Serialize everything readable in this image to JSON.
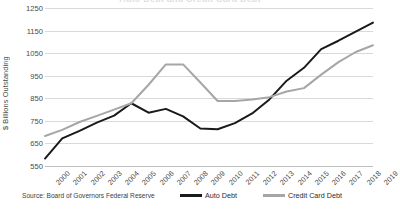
{
  "chart_data": {
    "type": "line",
    "title": "Auto Debt and Credit Card Debt",
    "xlabel": "",
    "ylabel": "$ Billions Outstanding",
    "ylim": [
      550,
      1250
    ],
    "ytick_step": 100,
    "yticks": [
      1250,
      1150,
      1050,
      950,
      850,
      750,
      650,
      550
    ],
    "grid": true,
    "legend_position": "bottom",
    "categories": [
      "2000",
      "2001",
      "2002",
      "2003",
      "2004",
      "2005",
      "2006",
      "2007",
      "2008",
      "2009",
      "2010",
      "2011",
      "2012",
      "2013",
      "2014",
      "2015",
      "2016",
      "2017",
      "2018",
      "2019"
    ],
    "series": [
      {
        "name": "Auto Debt",
        "color": "#1a1a1a",
        "values": [
          583,
          672,
          706,
          742,
          773,
          828,
          786,
          803,
          770,
          716,
          713,
          740,
          783,
          845,
          928,
          985,
          1068,
          1105,
          1145,
          1185
        ]
      },
      {
        "name": "Credit Card Debt",
        "color": "#a6a6a6",
        "values": [
          683,
          710,
          745,
          772,
          800,
          828,
          910,
          1000,
          1000,
          920,
          838,
          838,
          845,
          855,
          880,
          895,
          955,
          1010,
          1055,
          1085
        ]
      }
    ],
    "annotations": {
      "source": "Source: Board of Governors Federal Reserve"
    }
  },
  "legend": {
    "items": [
      {
        "label": "Auto Debt",
        "color": "#1a1a1a"
      },
      {
        "label": "Credit Card Debt",
        "color": "#a6a6a6"
      }
    ]
  }
}
